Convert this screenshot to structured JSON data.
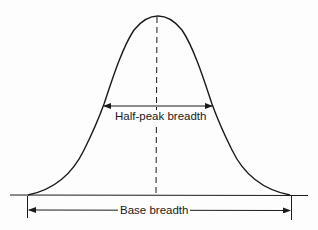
{
  "diagram": {
    "type": "peak-breadth",
    "labels": {
      "half_peak": "Half-peak breadth",
      "base": "Base breadth"
    },
    "colors": {
      "ink": "#1a1a1a",
      "background": "#fdfdfd"
    }
  }
}
